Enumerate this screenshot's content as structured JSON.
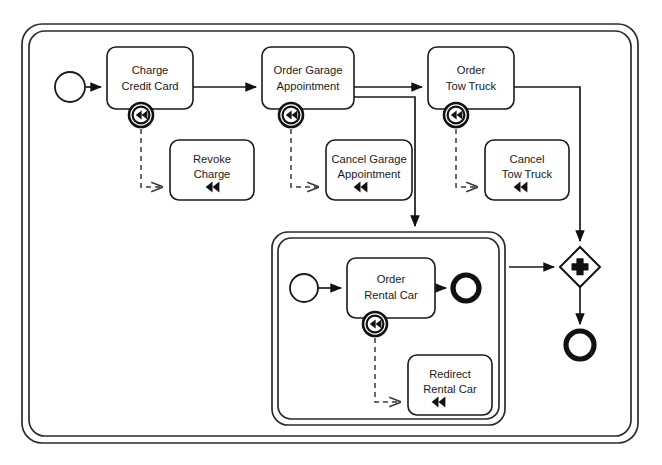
{
  "diagram": {
    "notation": "BPMN 2.0",
    "background_color": "#ffffff",
    "line_color": "#1a1a1a"
  },
  "containers": [
    {
      "id": "outer-transaction",
      "name": "outer-transaction-boundary",
      "type": "transaction-subprocess",
      "label": "",
      "border": "double",
      "x": 22,
      "y": 24,
      "width": 616,
      "height": 419
    },
    {
      "id": "inner-transaction",
      "name": "rental-car-subprocess-boundary",
      "type": "transaction-subprocess",
      "label": "",
      "border": "double",
      "x": 272,
      "y": 232,
      "width": 233,
      "height": 193
    }
  ],
  "events": [
    {
      "id": "start-event-main",
      "name": "start-event",
      "type": "start",
      "label": "",
      "cx": 70,
      "cy": 87,
      "r": 15
    },
    {
      "id": "start-event-sub",
      "name": "subprocess-start-event",
      "type": "start",
      "label": "",
      "cx": 304,
      "cy": 288,
      "r": 14
    },
    {
      "id": "end-event-sub",
      "name": "subprocess-end-event",
      "type": "end",
      "label": "",
      "cx": 466,
      "cy": 288,
      "r": 14
    },
    {
      "id": "end-event-main",
      "name": "end-event",
      "type": "end",
      "label": "",
      "cx": 580,
      "cy": 345,
      "r": 15
    }
  ],
  "gateway": {
    "id": "parallel-gateway",
    "name": "parallel-join-gateway",
    "type": "parallel",
    "marker": "plus",
    "label": "",
    "cx": 580,
    "cy": 267,
    "halfsize": 20
  },
  "tasks": [
    {
      "id": "task-charge-credit-card",
      "name": "task-charge-credit-card",
      "lines": [
        "Charge",
        "Credit Card"
      ],
      "x": 107,
      "y": 47,
      "width": 86,
      "height": 62,
      "compensation_marker": false,
      "boundary_event": {
        "name": "compensation-boundary-event-charge-credit-card",
        "cx": 141,
        "cy": 115,
        "r": 12,
        "icon": "compensation-rewind-icon"
      }
    },
    {
      "id": "task-order-garage-appointment",
      "name": "task-order-garage-appointment",
      "lines": [
        "Order Garage",
        "Appointment"
      ],
      "x": 262,
      "y": 47,
      "width": 92,
      "height": 62,
      "compensation_marker": false,
      "boundary_event": {
        "name": "compensation-boundary-event-order-garage-appointment",
        "cx": 291,
        "cy": 115,
        "r": 12,
        "icon": "compensation-rewind-icon"
      }
    },
    {
      "id": "task-order-tow-truck",
      "name": "task-order-tow-truck",
      "lines": [
        "Order",
        "Tow Truck"
      ],
      "x": 428,
      "y": 47,
      "width": 86,
      "height": 62,
      "compensation_marker": false,
      "boundary_event": {
        "name": "compensation-boundary-event-order-tow-truck",
        "cx": 456,
        "cy": 115,
        "r": 12,
        "icon": "compensation-rewind-icon"
      }
    },
    {
      "id": "task-order-rental-car",
      "name": "task-order-rental-car",
      "lines": [
        "Order",
        "Rental Car"
      ],
      "x": 347,
      "y": 258,
      "width": 88,
      "height": 60,
      "compensation_marker": false,
      "boundary_event": {
        "name": "compensation-boundary-event-order-rental-car",
        "cx": 375,
        "cy": 324,
        "r": 12,
        "icon": "compensation-rewind-icon"
      }
    }
  ],
  "compensation_tasks": [
    {
      "id": "task-revoke-charge",
      "name": "compensation-task-revoke-charge",
      "lines": [
        "Revoke",
        "Charge"
      ],
      "x": 170,
      "y": 140,
      "width": 84,
      "height": 60,
      "marker": "compensation-rewind-icon",
      "marker_cx": 212,
      "marker_cy": 187
    },
    {
      "id": "task-cancel-garage-appointment",
      "name": "compensation-task-cancel-garage-appointment",
      "lines": [
        "Cancel Garage",
        "Appointment"
      ],
      "x": 326,
      "y": 140,
      "width": 86,
      "height": 60,
      "marker": "compensation-rewind-icon",
      "marker_cx": 360,
      "marker_cy": 187
    },
    {
      "id": "task-cancel-tow-truck",
      "name": "compensation-task-cancel-tow-truck",
      "lines": [
        "Cancel",
        "Tow Truck"
      ],
      "x": 485,
      "y": 140,
      "width": 84,
      "height": 60,
      "marker": "compensation-rewind-icon",
      "marker_cx": 520,
      "marker_cy": 187
    },
    {
      "id": "task-redirect-rental-car",
      "name": "compensation-task-redirect-rental-car",
      "lines": [
        "Redirect",
        "Rental Car"
      ],
      "x": 408,
      "y": 355,
      "width": 84,
      "height": 60,
      "marker": "compensation-rewind-icon",
      "marker_cx": 438,
      "marker_cy": 402
    }
  ],
  "sequence_flows": [
    {
      "name": "flow-start-to-charge-credit-card",
      "path": "M 86 87 L 103 87"
    },
    {
      "name": "flow-charge-to-order-garage",
      "path": "M 193 87 L 258 87"
    },
    {
      "name": "flow-order-garage-to-order-tow-truck",
      "path": "M 354 87 L 424 87"
    },
    {
      "name": "flow-order-garage-to-subprocess",
      "path": "M 354 97 L 415 97 L 415 228"
    },
    {
      "name": "flow-order-tow-truck-to-gateway",
      "path": "M 514 87 L 580 87 L 580 243"
    },
    {
      "name": "flow-subprocess-start-to-order-rental-car",
      "path": "M 318 288 L 343 288"
    },
    {
      "name": "flow-order-rental-car-to-subprocess-end",
      "path": "M 435 288 L 448 288"
    },
    {
      "name": "flow-subprocess-to-gateway",
      "path": "M 509 267 L 556 267"
    },
    {
      "name": "flow-gateway-to-end-event",
      "path": "M 580 287 L 580 326"
    }
  ],
  "compensation_associations": [
    {
      "name": "assoc-charge-to-revoke-charge",
      "path": "M 141 129 L 141 187 L 164 187"
    },
    {
      "name": "assoc-order-garage-to-cancel-garage",
      "path": "M 291 129 L 291 187 L 320 187"
    },
    {
      "name": "assoc-order-tow-truck-to-cancel-tow-truck",
      "path": "M 456 129 L 456 187 L 479 187"
    },
    {
      "name": "assoc-order-rental-car-to-redirect-rental-car",
      "path": "M 375 338 L 375 402 L 402 402"
    }
  ],
  "legend": {
    "compensation_icon_name": "compensation-rewind-icon",
    "parallel_gateway_icon_name": "plus-icon"
  }
}
